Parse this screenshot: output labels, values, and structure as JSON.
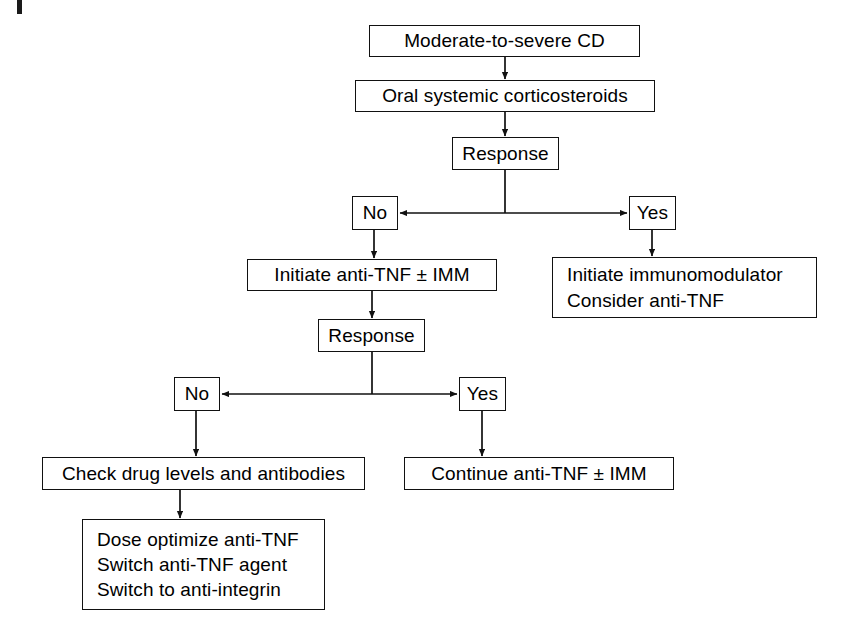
{
  "diagram": {
    "line_color": "#111111",
    "background": "#ffffff"
  },
  "nodes": {
    "start": {
      "label": "Moderate-to-severe CD"
    },
    "corticosteroids": {
      "label": "Oral systemic corticosteroids"
    },
    "response_1": {
      "label": "Response"
    },
    "no_1": {
      "label": "No"
    },
    "yes_1": {
      "label": "Yes"
    },
    "initiate_antitnf": {
      "label": "Initiate anti-TNF ± IMM"
    },
    "initiate_immunomodulator": {
      "line_1": "Initiate immunomodulator",
      "line_2": "Consider anti-TNF"
    },
    "response_2": {
      "label": "Response"
    },
    "no_2": {
      "label": "No"
    },
    "yes_2": {
      "label": "Yes"
    },
    "check_levels": {
      "label": "Check drug levels and antibodies"
    },
    "continue_antitnf": {
      "label": "Continue anti-TNF ± IMM"
    },
    "options": {
      "line_1": "Dose optimize anti-TNF",
      "line_2": "Switch anti-TNF agent",
      "line_3": "Switch to anti-integrin"
    }
  },
  "edges": [
    {
      "name": "start-to-corticosteroids",
      "from": "start",
      "to": "corticosteroids",
      "arrow": true
    },
    {
      "name": "corticosteroids-to-response-1",
      "from": "corticosteroids",
      "to": "response_1",
      "arrow": true
    },
    {
      "name": "response-1-to-no-1",
      "from": "response_1",
      "to": "no_1",
      "arrow": true
    },
    {
      "name": "response-1-to-yes-1",
      "from": "response_1",
      "to": "yes_1",
      "arrow": true
    },
    {
      "name": "no-1-to-initiate-antitnf",
      "from": "no_1",
      "to": "initiate_antitnf",
      "arrow": true
    },
    {
      "name": "yes-1-to-initiate-immunomodulator",
      "from": "yes_1",
      "to": "initiate_immunomodulator",
      "arrow": true
    },
    {
      "name": "initiate-antitnf-to-response-2",
      "from": "initiate_antitnf",
      "to": "response_2",
      "arrow": true
    },
    {
      "name": "response-2-to-no-2",
      "from": "response_2",
      "to": "no_2",
      "arrow": true
    },
    {
      "name": "response-2-to-yes-2",
      "from": "response_2",
      "to": "yes_2",
      "arrow": true
    },
    {
      "name": "no-2-to-check-levels",
      "from": "no_2",
      "to": "check_levels",
      "arrow": true
    },
    {
      "name": "yes-2-to-continue-antitnf",
      "from": "yes_2",
      "to": "continue_antitnf",
      "arrow": true
    },
    {
      "name": "check-levels-to-options",
      "from": "check_levels",
      "to": "options",
      "arrow": true
    }
  ]
}
